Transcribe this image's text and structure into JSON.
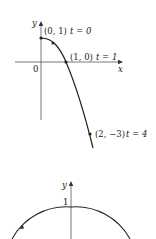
{
  "top_graph": {
    "x_axis_label": "x",
    "y_axis_label": "y",
    "origin_label": "0",
    "points": [
      {
        "coord": "(0, 1)",
        "t": "t = 0"
      },
      {
        "coord": "(1, 0)",
        "t": "t = 1"
      },
      {
        "coord": "(2, −3)",
        "t": "t = 4"
      }
    ]
  },
  "bottom_graph": {
    "y_axis_label": "y",
    "tick_label": "1"
  },
  "colors": {
    "stroke": "#222222",
    "axis": "#555555"
  }
}
